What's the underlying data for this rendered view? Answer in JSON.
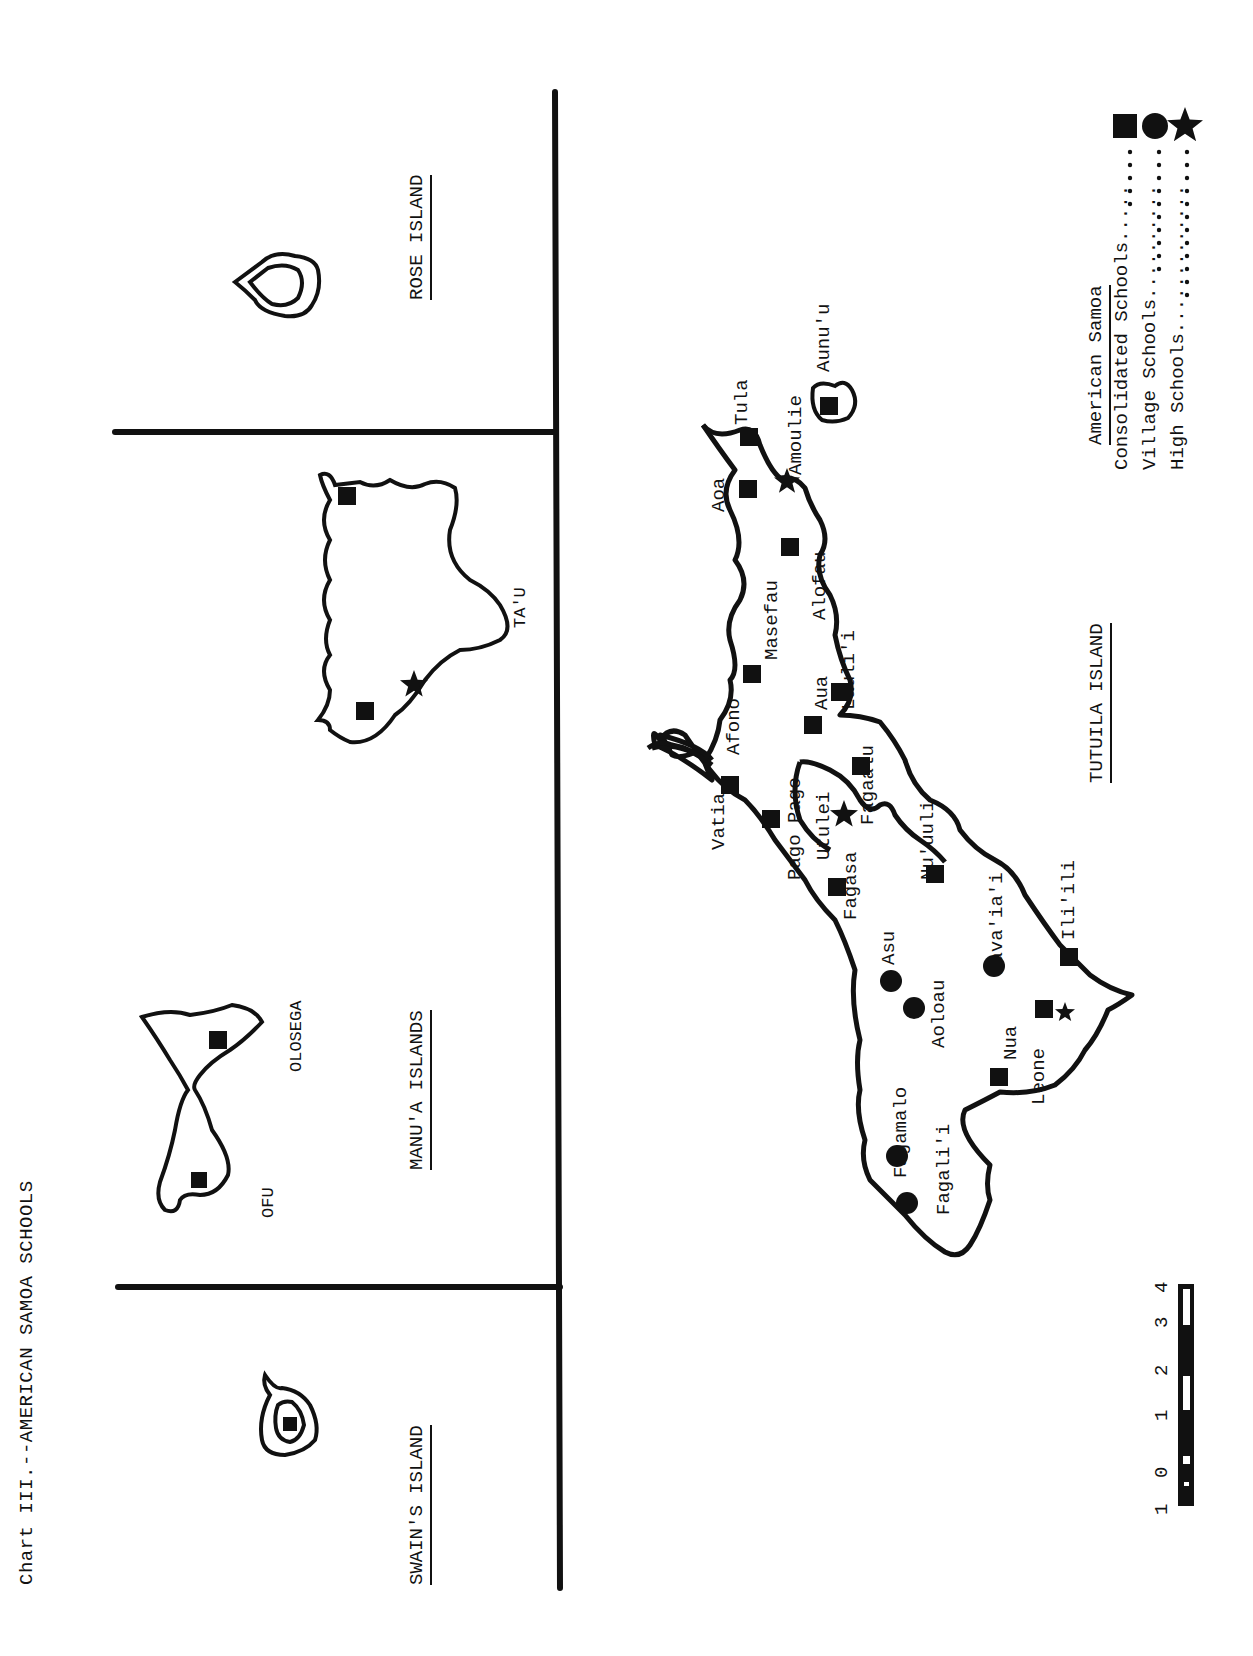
{
  "title": "Chart III.--AMERICAN SAMOA SCHOOLS",
  "regions": {
    "rose": "ROSE ISLAND",
    "manua": "MANU'A ISLANDS",
    "swains": "SWAIN'S ISLAND",
    "tutuila": "TUTUILA ISLAND"
  },
  "islands": {
    "tau": "TA'U",
    "olosega": "OLOSEGA",
    "ofu": "OFU",
    "aunuu": "Aunu'u"
  },
  "villages": [
    {
      "name": "Tula",
      "type": "consolidated"
    },
    {
      "name": "Amoulie",
      "type": "high"
    },
    {
      "name": "Aoa",
      "type": "consolidated"
    },
    {
      "name": "Alofau",
      "type": "consolidated"
    },
    {
      "name": "Masefau",
      "type": "consolidated"
    },
    {
      "name": "Lauli'i",
      "type": "consolidated"
    },
    {
      "name": "Afono",
      "type": "consolidated"
    },
    {
      "name": "Aua",
      "type": "consolidated"
    },
    {
      "name": "Vatia",
      "type": "consolidated"
    },
    {
      "name": "Pago Pago",
      "type": "consolidated"
    },
    {
      "name": "Utulei",
      "type": "high"
    },
    {
      "name": "Fagaalu",
      "type": "consolidated"
    },
    {
      "name": "Nu'uuli",
      "type": "consolidated"
    },
    {
      "name": "Fagasa",
      "type": "consolidated"
    },
    {
      "name": "Asu",
      "type": "village"
    },
    {
      "name": "Aoloau",
      "type": "village"
    },
    {
      "name": "Pava'ia'i",
      "type": "village"
    },
    {
      "name": "Ili'ili",
      "type": "consolidated"
    },
    {
      "name": "Leone",
      "type": "consolidated+high"
    },
    {
      "name": "Nua",
      "type": "consolidated"
    },
    {
      "name": "Fagamalo",
      "type": "village"
    },
    {
      "name": "Fagali'i",
      "type": "village"
    }
  ],
  "legend": {
    "heading": "American Samoa",
    "items": [
      {
        "label": "Consolidated Schools.....",
        "symbol": "square"
      },
      {
        "label": "Village Schools..........",
        "symbol": "circle"
      },
      {
        "label": "High Schools.............",
        "symbol": "star"
      }
    ]
  },
  "scale": {
    "ticks": [
      "1",
      "0",
      "1",
      "2",
      "3",
      "4"
    ]
  }
}
